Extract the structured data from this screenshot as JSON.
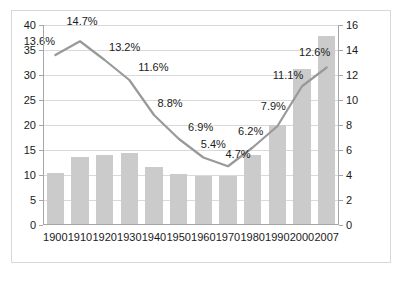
{
  "chart_data": {
    "type": "bar",
    "title": "",
    "subtitle": "",
    "xlabel": "",
    "ylabel": "",
    "categories": [
      "1900",
      "1910",
      "1920",
      "1930",
      "1940",
      "1950",
      "1960",
      "1970",
      "1980",
      "1990",
      "2000",
      "2007"
    ],
    "grid": true,
    "legend": "none",
    "axes": {
      "left": {
        "ylim": [
          0,
          40
        ],
        "ticks": [
          0,
          5,
          10,
          15,
          20,
          25,
          30,
          35,
          40
        ],
        "tick_labels": [
          "0",
          "5",
          "10",
          "15",
          "20",
          "25",
          "30",
          "35",
          "40"
        ]
      },
      "right": {
        "ylim": [
          0,
          16
        ],
        "ticks": [
          0,
          2,
          4,
          6,
          8,
          10,
          12,
          14,
          16
        ],
        "tick_labels": [
          "0",
          "2",
          "4",
          "6",
          "8",
          "10",
          "12",
          "14",
          "16"
        ]
      }
    },
    "series": [
      {
        "name": "bars",
        "type": "bar",
        "axis": "left",
        "color": "#cbcbcb",
        "values": [
          10.2,
          13.4,
          13.8,
          14.2,
          11.5,
          10.1,
          9.6,
          9.6,
          13.9,
          19.8,
          31.1,
          37.6
        ]
      },
      {
        "name": "line",
        "type": "line",
        "axis": "right",
        "color": "#999999",
        "values": [
          13.6,
          14.7,
          13.2,
          11.6,
          8.8,
          6.9,
          5.4,
          4.7,
          6.2,
          7.9,
          11.1,
          12.6
        ],
        "data_labels": [
          "13.6%",
          "14.7%",
          "13.2%",
          "11.6%",
          "8.8%",
          "6.9%",
          "5.4%",
          "4.7%",
          "6.2%",
          "7.9%",
          "11.1%",
          "12.6%"
        ]
      }
    ]
  },
  "colors": {
    "bar": "#cbcbcb",
    "line": "#999999",
    "grid": "#d9d9d9",
    "axis": "#a6a6a6",
    "text": "#1a1a1a",
    "border": "#d8d8d8",
    "background": "#ffffff"
  }
}
